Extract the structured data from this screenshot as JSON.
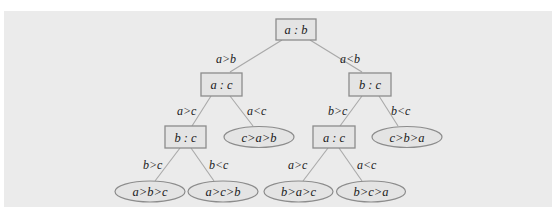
{
  "diagram": {
    "type": "decision-tree",
    "colors": {
      "panel_bg": "#ebebeb",
      "node_fill": "#e4e4e4",
      "node_stroke": "#8c8c8c",
      "edge_stroke": "#a9a9a9",
      "text": "#1a1a1a"
    },
    "nodes": {
      "root": {
        "label": "a : b",
        "shape": "box"
      },
      "left": {
        "label": "a : c",
        "shape": "box"
      },
      "right": {
        "label": "b : c",
        "shape": "box"
      },
      "left_left": {
        "label": "b : c",
        "shape": "box"
      },
      "left_right": {
        "label": "c>a>b",
        "shape": "ellipse"
      },
      "right_left": {
        "label": "a : c",
        "shape": "box"
      },
      "right_right": {
        "label": "c>b>a",
        "shape": "ellipse"
      },
      "ll_left": {
        "label": "a>b>c",
        "shape": "ellipse"
      },
      "ll_right": {
        "label": "a>c>b",
        "shape": "ellipse"
      },
      "rl_left": {
        "label": "b>a>c",
        "shape": "ellipse"
      },
      "rl_right": {
        "label": "b>c>a",
        "shape": "ellipse"
      }
    },
    "edges": {
      "root_left": "a>b",
      "root_right": "a<b",
      "left_left": "a>c",
      "left_right": "a<c",
      "right_left": "b>c",
      "right_right": "b<c",
      "ll_left": "b>c",
      "ll_right": "b<c",
      "rl_left": "a>c",
      "rl_right": "a<c"
    }
  }
}
